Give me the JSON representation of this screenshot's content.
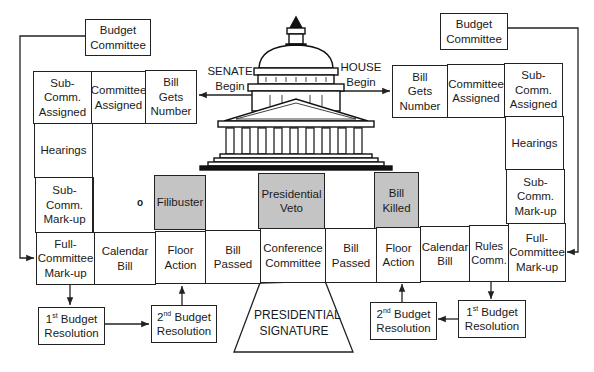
{
  "diagram": {
    "senate_label": "SENATE\nBegin",
    "house_label": "HOUSE\nBegin",
    "center_label": "PRESIDENTIAL\nSIGNATURE",
    "mark": "o",
    "left_budget_committee": "Budget\nCommittee",
    "right_budget_committee": "Budget\nCommittee",
    "senate_top": [
      "Sub-Comm.\nAssigned",
      "Committee\nAssigned",
      "Bill\nGets\nNumber"
    ],
    "senate_side": [
      "Hearings",
      "Sub-Comm.\nMark-up"
    ],
    "house_top": [
      "Bill\nGets\nNumber",
      "Committee\nAssigned",
      "Sub-Comm.\nAssigned"
    ],
    "house_side": [
      "Hearings",
      "Sub-Comm.\nMark-up"
    ],
    "bottom_row": [
      "Full-\nCommittee\nMark-up",
      "Calendar\nBill",
      "Floor\nAction",
      "Bill\nPassed",
      "Conference\nCommittee",
      "Bill\nPassed",
      "Floor\nAction",
      "Calendar\nBill",
      "Rules\nComm.",
      "Full-\nCommittee\nMark-up"
    ],
    "gray_boxes": {
      "filibuster": "Filibuster",
      "veto": "Presidential\nVeto",
      "killed": "Bill\nKilled"
    },
    "budget_resolutions": {
      "left_first": {
        "ord": "1",
        "sup": "st",
        "text": " Budget",
        "line2": "Resolution"
      },
      "left_second": {
        "ord": "2",
        "sup": "nd",
        "text": " Budget",
        "line2": "Resolution"
      },
      "right_second": {
        "ord": "2",
        "sup": "nd",
        "text": " Budget",
        "line2": "Resolution"
      },
      "right_first": {
        "ord": "1",
        "sup": "st",
        "text": " Budget",
        "line2": "Resolution"
      }
    },
    "colors": {
      "line": "#222222",
      "gray_fill": "#c4c4c4",
      "background": "#ffffff"
    }
  }
}
